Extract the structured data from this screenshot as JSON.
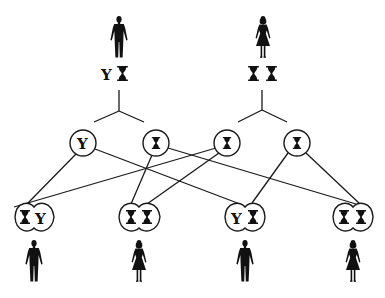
{
  "diagram": {
    "colors": {
      "ink": "#111111",
      "background": "#ffffff"
    },
    "chromosome_glyphs": {
      "X": "hourglass-x-chromosome",
      "Y": "Y"
    },
    "parents": [
      {
        "id": "father",
        "sex": "male",
        "icon": "male-figure-icon",
        "chromosomes": [
          "Y",
          "X"
        ],
        "x": 119
      },
      {
        "id": "mother",
        "sex": "female",
        "icon": "female-figure-icon",
        "chromosomes": [
          "X",
          "X"
        ],
        "x": 263
      }
    ],
    "gametes": [
      {
        "id": "g1",
        "from": "father",
        "chromosome": "Y",
        "x": 83,
        "y": 143
      },
      {
        "id": "g2",
        "from": "father",
        "chromosome": "X",
        "x": 156,
        "y": 143
      },
      {
        "id": "g3",
        "from": "mother",
        "chromosome": "X",
        "x": 227,
        "y": 143
      },
      {
        "id": "g4",
        "from": "mother",
        "chromosome": "X",
        "x": 297,
        "y": 143
      }
    ],
    "offspring": [
      {
        "id": "o1",
        "sex": "male",
        "icon": "male-figure-icon",
        "chromosomes": [
          "X",
          "Y"
        ],
        "x": 34,
        "parents_gametes": [
          "g1",
          "g3"
        ]
      },
      {
        "id": "o2",
        "sex": "female",
        "icon": "female-figure-icon",
        "chromosomes": [
          "X",
          "X"
        ],
        "x": 139,
        "parents_gametes": [
          "g2",
          "g3"
        ]
      },
      {
        "id": "o3",
        "sex": "male",
        "icon": "male-figure-icon",
        "chromosomes": [
          "Y",
          "X"
        ],
        "x": 245,
        "parents_gametes": [
          "g1",
          "g4"
        ]
      },
      {
        "id": "o4",
        "sex": "female",
        "icon": "female-figure-icon",
        "chromosomes": [
          "X",
          "X"
        ],
        "x": 353,
        "parents_gametes": [
          "g2",
          "g4"
        ]
      }
    ]
  }
}
